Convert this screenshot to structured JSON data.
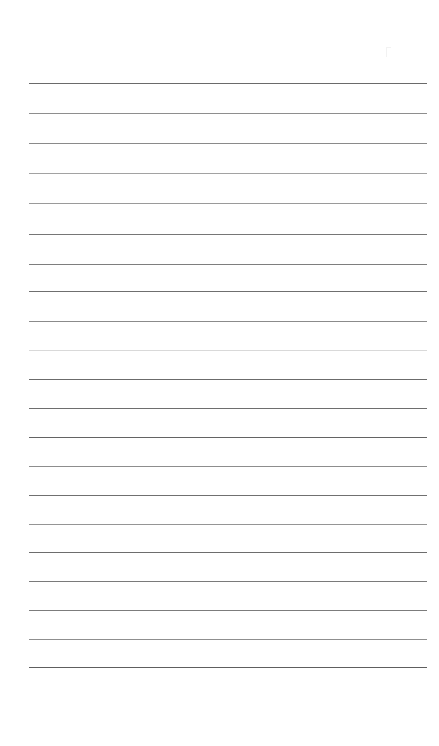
{
  "document": {
    "kind": "lined-paper-scan",
    "title": "Blank ruled notepad page",
    "page_width": 439,
    "page_height": 746,
    "background_color": "#ffffff",
    "content_text": "",
    "handwriting_present": "no",
    "margin_rule_present": "no"
  },
  "ruling": {
    "line_count": 20,
    "left_x": 29,
    "right_x": 427,
    "line_length": 398,
    "first_line_y": 83,
    "line_spacing": 30,
    "bottom_margin_start_y": 668,
    "default_color": "#8c8c8c",
    "dark_color": "#5e5e5e",
    "faint_color": "#d9d9d9",
    "lines": [
      {
        "index": 1,
        "y": 83,
        "color": "#6a6a6a",
        "thickness": 1,
        "opacity": 1.0
      },
      {
        "index": 2,
        "y": 113,
        "color": "#8e8e8e",
        "thickness": 1,
        "opacity": 1.0
      },
      {
        "index": 3,
        "y": 143,
        "color": "#8a8a8a",
        "thickness": 1,
        "opacity": 1.0
      },
      {
        "index": 4,
        "y": 173,
        "color": "#a2a2a2",
        "thickness": 1,
        "opacity": 1.0
      },
      {
        "index": 5,
        "y": 203,
        "color": "#9a9a9a",
        "thickness": 1,
        "opacity": 1.0
      },
      {
        "index": 6,
        "y": 234,
        "color": "#767676",
        "thickness": 1,
        "opacity": 1.0
      },
      {
        "index": 7,
        "y": 264,
        "color": "#7e7e7e",
        "thickness": 1,
        "opacity": 1.0
      },
      {
        "index": 8,
        "y": 291,
        "color": "#6f6f6f",
        "thickness": 1,
        "opacity": 1.0
      },
      {
        "index": 9,
        "y": 321,
        "color": "#8b8b8b",
        "thickness": 1,
        "opacity": 1.0
      },
      {
        "index": 10,
        "y": 350,
        "color": "#d9d9d9",
        "thickness": 1,
        "opacity": 1.0
      },
      {
        "index": 11,
        "y": 379,
        "color": "#6b6b6b",
        "thickness": 1,
        "opacity": 1.0
      },
      {
        "index": 12,
        "y": 408,
        "color": "#6e6e6e",
        "thickness": 1,
        "opacity": 1.0
      },
      {
        "index": 13,
        "y": 437,
        "color": "#636363",
        "thickness": 1,
        "opacity": 1.0
      },
      {
        "index": 14,
        "y": 466,
        "color": "#8d8d8d",
        "thickness": 1,
        "opacity": 1.0
      },
      {
        "index": 15,
        "y": 495,
        "color": "#707070",
        "thickness": 1,
        "opacity": 1.0
      },
      {
        "index": 16,
        "y": 524,
        "color": "#959595",
        "thickness": 1,
        "opacity": 1.0
      },
      {
        "index": 17,
        "y": 552,
        "color": "#6d6d6d",
        "thickness": 1,
        "opacity": 1.0
      },
      {
        "index": 18,
        "y": 581,
        "color": "#7a7a7a",
        "thickness": 1,
        "opacity": 1.0
      },
      {
        "index": 19,
        "y": 610,
        "color": "#7c7c7c",
        "thickness": 1,
        "opacity": 1.0
      },
      {
        "index": 20,
        "y": 639,
        "color": "#8f8f8f",
        "thickness": 1,
        "opacity": 1.0
      },
      {
        "index": 21,
        "y": 667,
        "color": "#5e5e5e",
        "thickness": 1,
        "opacity": 1.0
      }
    ]
  },
  "artifacts": {
    "specks": [
      {
        "name": "faint-speck",
        "x": 386,
        "y": 47,
        "width": 4,
        "height": 9,
        "color": "#f0f0f0"
      }
    ]
  }
}
